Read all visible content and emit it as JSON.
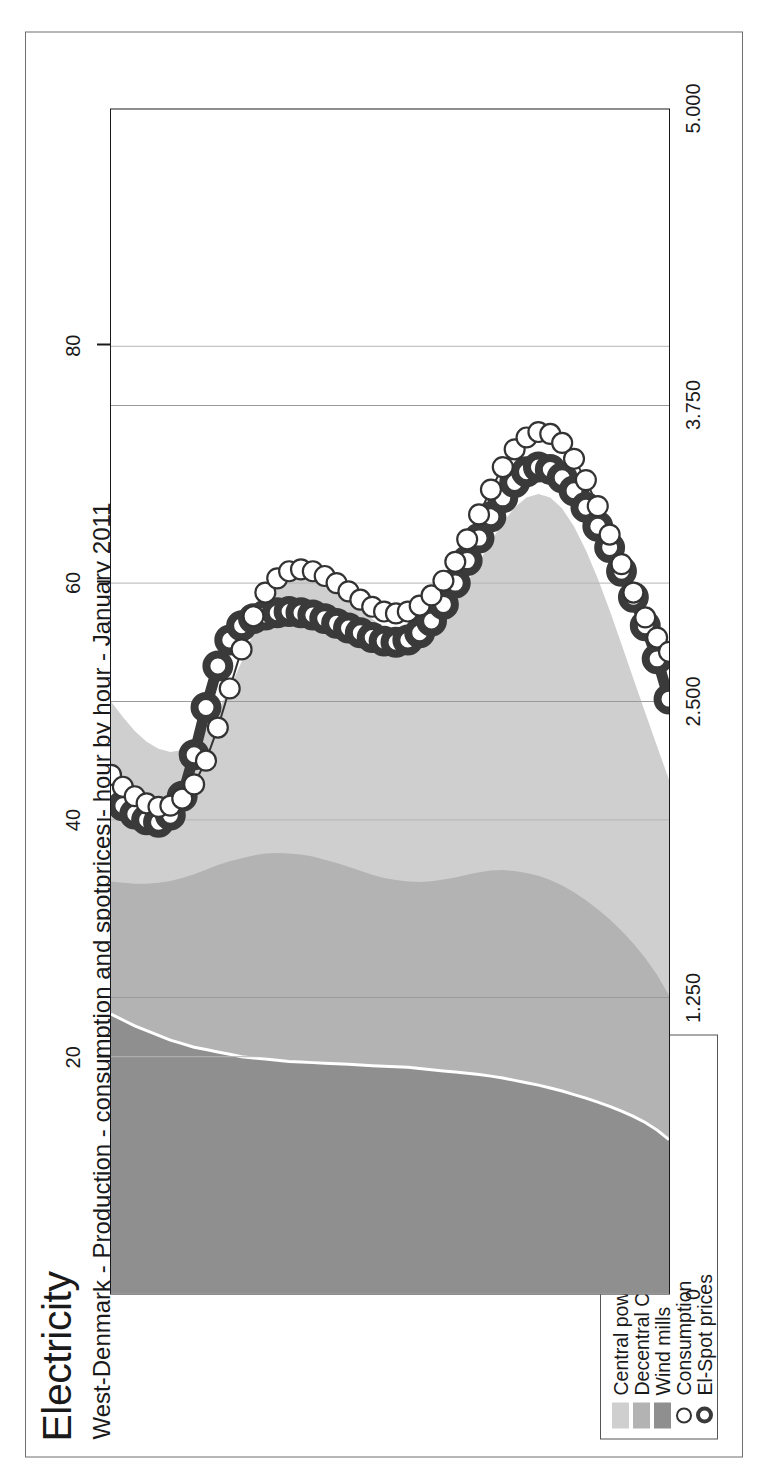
{
  "header": {
    "title": "Electricity",
    "subtitle": "West-Denmark - Production - consumption and spotprices - hour by hour - January 2011"
  },
  "axes": {
    "left_title_line1": "Electricity",
    "left_title_line2": "MWh/h",
    "right_title_line1": "Prices",
    "right_title_line2": "EUR/MWh",
    "left_ticks": [
      "5.000",
      "3.750",
      "2.500",
      "1.250",
      "0"
    ],
    "right_ticks": [
      "80",
      "60",
      "40",
      "20"
    ]
  },
  "legend": {
    "items": [
      {
        "label": "Central powerplants",
        "marker": "area-swatch",
        "color": "#cfcfcf"
      },
      {
        "label": "Decentral CHP",
        "marker": "area-swatch",
        "color": "#b3b3b3"
      },
      {
        "label": "Wind mills",
        "marker": "area-swatch",
        "color": "#8f8f8f"
      },
      {
        "label": "Consumption",
        "marker": "open-circle-thin",
        "color": "#333333"
      },
      {
        "label": "El-Spot prices",
        "marker": "open-circle-thick",
        "color": "#3a3a3a"
      }
    ]
  },
  "chart_data": {
    "type": "area",
    "title": "Electricity",
    "subtitle": "West-Denmark - Production - consumption and spotprices - hour by hour - January 2011",
    "xlabel": "",
    "ylabel": "Electricity MWh/h",
    "y2label": "Prices EUR/MWh",
    "ylim": [
      0,
      5000
    ],
    "y2lim": [
      0,
      100
    ],
    "yticks": [
      0,
      1250,
      2500,
      3750,
      5000
    ],
    "ytick_labels": [
      "0",
      "1.250",
      "2.500",
      "3.750",
      "5.000"
    ],
    "y2ticks": [
      20,
      40,
      60,
      80
    ],
    "y2tick_labels": [
      "20",
      "40",
      "60",
      "80"
    ],
    "grid": true,
    "legend_position": "outside-left",
    "x": [
      1,
      2,
      3,
      4,
      5,
      6,
      7,
      8,
      9,
      10,
      11,
      12,
      13,
      14,
      15,
      16,
      17,
      18,
      19,
      20,
      21,
      22,
      23,
      24,
      25,
      26,
      27,
      28,
      29,
      30,
      31,
      32,
      33,
      34,
      35,
      36,
      37,
      38,
      39,
      40,
      41,
      42,
      43,
      44,
      45,
      46,
      47,
      48
    ],
    "stacked_series": [
      {
        "name": "Wind mills",
        "color": "#8f8f8f",
        "values": [
          1180,
          1155,
          1130,
          1110,
          1090,
          1070,
          1055,
          1040,
          1030,
          1020,
          1010,
          1000,
          995,
          990,
          985,
          980,
          978,
          975,
          972,
          970,
          968,
          965,
          962,
          960,
          958,
          955,
          950,
          945,
          940,
          935,
          930,
          925,
          918,
          910,
          900,
          890,
          880,
          868,
          855,
          840,
          825,
          808,
          790,
          770,
          748,
          722,
          690,
          650
        ]
      },
      {
        "name": "Decentral CHP",
        "color": "#b3b3b3",
        "values": [
          560,
          580,
          600,
          620,
          645,
          672,
          700,
          730,
          760,
          790,
          815,
          838,
          855,
          868,
          875,
          878,
          876,
          870,
          860,
          848,
          834,
          820,
          806,
          795,
          788,
          785,
          788,
          796,
          808,
          822,
          838,
          854,
          868,
          878,
          884,
          886,
          884,
          878,
          868,
          854,
          836,
          815,
          790,
          762,
          730,
          695,
          655,
          610
        ]
      },
      {
        "name": "Central powerplants",
        "color": "#cfcfcf",
        "values": [
          760,
          700,
          645,
          600,
          565,
          545,
          540,
          555,
          590,
          650,
          730,
          830,
          940,
          1045,
          1130,
          1190,
          1220,
          1225,
          1210,
          1180,
          1145,
          1110,
          1080,
          1058,
          1046,
          1045,
          1056,
          1080,
          1118,
          1170,
          1235,
          1310,
          1390,
          1468,
          1535,
          1585,
          1612,
          1615,
          1592,
          1545,
          1478,
          1396,
          1305,
          1210,
          1118,
          1035,
          965,
          910
        ]
      }
    ],
    "line_series": [
      {
        "name": "Consumption",
        "color": "#333333",
        "marker": "open-circle-thin",
        "axis": "left",
        "values": [
          2190,
          2140,
          2100,
          2070,
          2055,
          2060,
          2090,
          2150,
          2250,
          2390,
          2555,
          2720,
          2860,
          2960,
          3020,
          3050,
          3058,
          3050,
          3030,
          3000,
          2965,
          2930,
          2900,
          2880,
          2872,
          2880,
          2905,
          2948,
          3010,
          3090,
          3185,
          3290,
          3395,
          3490,
          3565,
          3615,
          3638,
          3630,
          3592,
          3525,
          3435,
          3325,
          3205,
          3080,
          2960,
          2855,
          2770,
          2710
        ]
      },
      {
        "name": "El-Spot prices",
        "color": "#3a3a3a",
        "marker": "open-circle-thick",
        "axis": "right",
        "values": [
          42.5,
          41.2,
          40.5,
          40.0,
          39.8,
          40.4,
          42.0,
          45.5,
          49.5,
          53.0,
          55.2,
          56.4,
          57.0,
          57.3,
          57.5,
          57.6,
          57.5,
          57.3,
          57.0,
          56.6,
          56.2,
          55.8,
          55.4,
          55.1,
          55.0,
          55.2,
          55.8,
          56.8,
          58.2,
          60.0,
          61.9,
          63.8,
          65.6,
          67.2,
          68.5,
          69.4,
          69.8,
          69.6,
          68.9,
          67.8,
          66.4,
          64.8,
          63.0,
          61.0,
          58.8,
          56.4,
          53.6,
          50.2
        ]
      }
    ]
  }
}
